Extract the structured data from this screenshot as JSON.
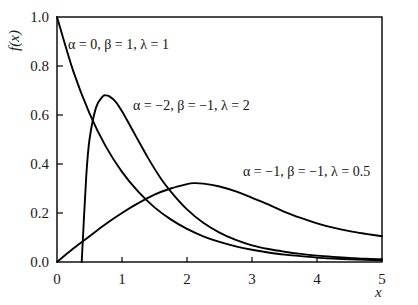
{
  "chart_data": {
    "type": "line",
    "title": "",
    "xlabel": "x",
    "ylabel": "f(x)",
    "xlim": [
      0,
      5
    ],
    "ylim": [
      0,
      1.0
    ],
    "grid": false,
    "legend_position": "inline-annotations",
    "xticks": [
      "0",
      "1",
      "2",
      "3",
      "4",
      "5"
    ],
    "xtick_values": [
      0,
      1,
      2,
      3,
      4,
      5
    ],
    "yticks": [
      "0.0",
      "0.2",
      "0.4",
      "0.6",
      "0.8",
      "1.0"
    ],
    "ytick_values": [
      0,
      0.2,
      0.4,
      0.6,
      0.8,
      1.0
    ],
    "line_color": "#000000",
    "frame_color": "#000000",
    "series": [
      {
        "name": "α = 0, β = 1, λ = 1",
        "annotation": "α = 0, β = 1, λ = 1",
        "alpha": 0,
        "beta": 1,
        "lambda": 1,
        "x": [
          0,
          0.25,
          0.5,
          0.75,
          1.0,
          1.25,
          1.5,
          1.75,
          2.0,
          2.25,
          2.5,
          2.75,
          3.0,
          3.25,
          3.5,
          3.75,
          4.0,
          4.25,
          4.5,
          4.75,
          5.0
        ],
        "values": [
          1.0,
          0.779,
          0.607,
          0.472,
          0.368,
          0.287,
          0.223,
          0.174,
          0.135,
          0.105,
          0.082,
          0.064,
          0.05,
          0.039,
          0.03,
          0.024,
          0.018,
          0.014,
          0.011,
          0.009,
          0.007
        ]
      },
      {
        "name": "α = -2, β = -1, λ = 2",
        "annotation": "α = −2, β = −1, λ = 2",
        "alpha": -2,
        "beta": -1,
        "lambda": 2,
        "x": [
          0.38,
          0.45,
          0.5,
          0.6,
          0.7,
          0.75,
          0.8,
          0.9,
          1.0,
          1.2,
          1.4,
          1.6,
          1.8,
          2.0,
          2.25,
          2.5,
          2.75,
          3.0,
          3.25,
          3.5,
          3.75,
          4.0,
          4.25,
          4.5,
          4.75,
          5.0
        ],
        "values": [
          0.0,
          0.35,
          0.5,
          0.63,
          0.675,
          0.68,
          0.677,
          0.655,
          0.615,
          0.52,
          0.425,
          0.34,
          0.272,
          0.215,
          0.16,
          0.12,
          0.09,
          0.068,
          0.053,
          0.042,
          0.033,
          0.026,
          0.021,
          0.017,
          0.013,
          0.011
        ]
      },
      {
        "name": "α = -1, β = -1, λ = 0.5",
        "annotation": "α = −1, β = −1, λ = 0.5",
        "alpha": -1,
        "beta": -1,
        "lambda": 0.5,
        "x": [
          0,
          0.25,
          0.5,
          0.75,
          1.0,
          1.25,
          1.5,
          1.75,
          2.0,
          2.1,
          2.25,
          2.5,
          2.75,
          3.0,
          3.25,
          3.5,
          3.75,
          4.0,
          4.25,
          4.5,
          4.75,
          5.0
        ],
        "values": [
          0.0,
          0.055,
          0.105,
          0.155,
          0.2,
          0.24,
          0.275,
          0.3,
          0.318,
          0.322,
          0.32,
          0.308,
          0.288,
          0.262,
          0.235,
          0.205,
          0.18,
          0.158,
          0.14,
          0.126,
          0.115,
          0.105
        ]
      }
    ]
  }
}
